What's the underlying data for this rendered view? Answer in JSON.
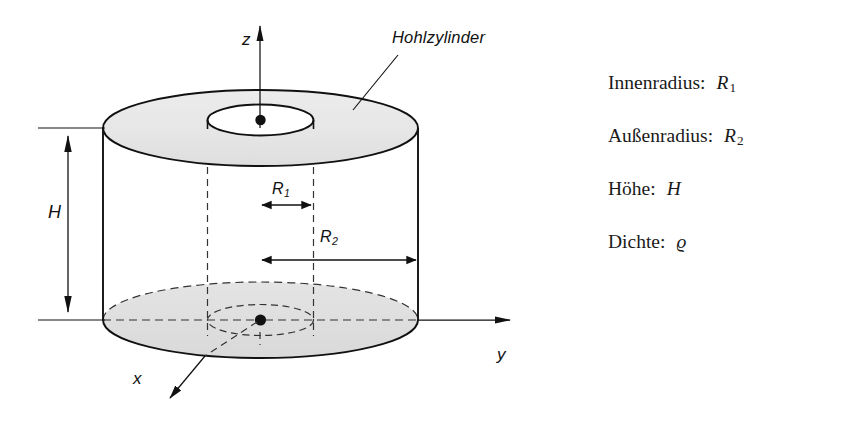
{
  "figure": {
    "annotation": "Hohlzylinder",
    "axes": {
      "z": "z",
      "y": "y",
      "x": "x"
    },
    "dimensions": {
      "height": "H",
      "inner_radius": "R",
      "inner_radius_sub": "1",
      "outer_radius": "R",
      "outer_radius_sub": "2"
    },
    "colors": {
      "line": "#111111",
      "fill_gray": "#e9e9e9",
      "fill_gray_dark": "#dcdcdc",
      "background": "#ffffff"
    }
  },
  "legend": {
    "rows": [
      {
        "term": "Innenradius:",
        "symbol": "R",
        "sub": "1"
      },
      {
        "term": "Außenradius:",
        "symbol": "R",
        "sub": "2"
      },
      {
        "term": "Höhe:",
        "symbol": "H",
        "sub": ""
      },
      {
        "term": "Dichte:",
        "symbol": "ϱ",
        "sub": ""
      }
    ]
  }
}
